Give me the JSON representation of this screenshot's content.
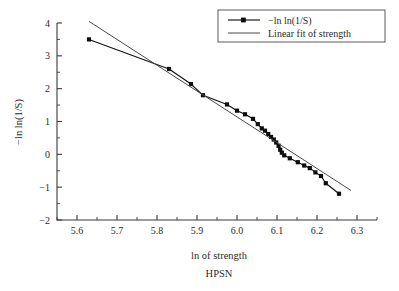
{
  "chart_data": {
    "type": "line",
    "title": "",
    "subtitle": "",
    "caption": "HPSN",
    "xlabel": "ln of strength",
    "ylabel": "−ln ln(1/S)",
    "xlim": [
      5.55,
      6.35
    ],
    "ylim": [
      -2,
      4
    ],
    "xticks": [
      5.6,
      5.7,
      5.8,
      5.9,
      6.0,
      6.1,
      6.2,
      6.3
    ],
    "xticklabels": [
      "5.6",
      "5.7",
      "5.8",
      "5.9",
      "6.0",
      "6.1",
      "6.2",
      "6.3"
    ],
    "yticks": [
      -2,
      -1,
      0,
      1,
      2,
      3,
      4
    ],
    "yticklabels": [
      "−2",
      "−1",
      "0",
      "1",
      "2",
      "3",
      "4"
    ],
    "xminor_step": 0.05,
    "yminor_step": 0.5,
    "grid": false,
    "legend_position": "top-right",
    "series": [
      {
        "name": "−ln ln(1/S)",
        "marker": "square",
        "color": "#0d0d0d",
        "x": [
          5.63,
          5.83,
          5.885,
          5.915,
          5.975,
          6.0,
          6.02,
          6.04,
          6.052,
          6.062,
          6.07,
          6.078,
          6.085,
          6.092,
          6.098,
          6.104,
          6.108,
          6.112,
          6.118,
          6.132,
          6.152,
          6.168,
          6.182,
          6.196,
          6.21,
          6.222,
          6.255
        ],
        "y": [
          3.5,
          2.6,
          2.14,
          1.8,
          1.52,
          1.33,
          1.22,
          1.08,
          0.92,
          0.79,
          0.72,
          0.62,
          0.53,
          0.45,
          0.36,
          0.26,
          0.14,
          0.05,
          -0.03,
          -0.12,
          -0.24,
          -0.34,
          -0.42,
          -0.55,
          -0.66,
          -0.88,
          -1.2
        ]
      },
      {
        "name": "Linear fit of strength",
        "marker": "none",
        "color": "#4a4a4a",
        "x": [
          5.63,
          6.285
        ],
        "y": [
          4.05,
          -1.1
        ]
      }
    ],
    "legend": [
      {
        "label": "−ln ln(1/S)",
        "style": "line-marker"
      },
      {
        "label": "Linear fit of strength",
        "style": "line"
      }
    ]
  }
}
